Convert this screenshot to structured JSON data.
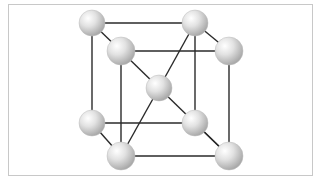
{
  "diagram": {
    "type": "crystal-lattice",
    "structure": "body-centered-cubic",
    "colors": {
      "background": "#ffffff",
      "frame_border": "#c8c8c8",
      "bond": "#2a2a2a",
      "atom_highlight": "#ffffff",
      "atom_mid": "#e2e2e2",
      "atom_shadow": "#a8a8a8"
    },
    "atoms": [
      {
        "id": "back-top-left",
        "cx": 92,
        "cy": 23,
        "r": 13
      },
      {
        "id": "back-top-right",
        "cx": 195,
        "cy": 23,
        "r": 13
      },
      {
        "id": "back-bottom-left",
        "cx": 92,
        "cy": 123,
        "r": 13
      },
      {
        "id": "back-bottom-right",
        "cx": 195,
        "cy": 123,
        "r": 13
      },
      {
        "id": "center",
        "cx": 159,
        "cy": 88,
        "r": 13
      },
      {
        "id": "front-top-left",
        "cx": 121,
        "cy": 51,
        "r": 14
      },
      {
        "id": "front-top-right",
        "cx": 229,
        "cy": 51,
        "r": 14
      },
      {
        "id": "front-bottom-left",
        "cx": 121,
        "cy": 156,
        "r": 14
      },
      {
        "id": "front-bottom-right",
        "cx": 229,
        "cy": 156,
        "r": 14
      }
    ],
    "bonds": [
      [
        "back-top-left",
        "back-top-right"
      ],
      [
        "back-top-left",
        "back-bottom-left"
      ],
      [
        "back-top-right",
        "back-bottom-right"
      ],
      [
        "back-bottom-left",
        "back-bottom-right"
      ],
      [
        "front-top-left",
        "front-top-right"
      ],
      [
        "front-top-left",
        "front-bottom-left"
      ],
      [
        "front-top-right",
        "front-bottom-right"
      ],
      [
        "front-bottom-left",
        "front-bottom-right"
      ],
      [
        "back-top-left",
        "front-top-left"
      ],
      [
        "back-top-right",
        "front-top-right"
      ],
      [
        "back-bottom-left",
        "front-bottom-left"
      ],
      [
        "back-bottom-right",
        "front-bottom-right"
      ],
      [
        "front-top-left",
        "center"
      ],
      [
        "back-top-right",
        "center"
      ],
      [
        "center",
        "front-bottom-left"
      ],
      [
        "center",
        "front-bottom-right"
      ]
    ]
  }
}
